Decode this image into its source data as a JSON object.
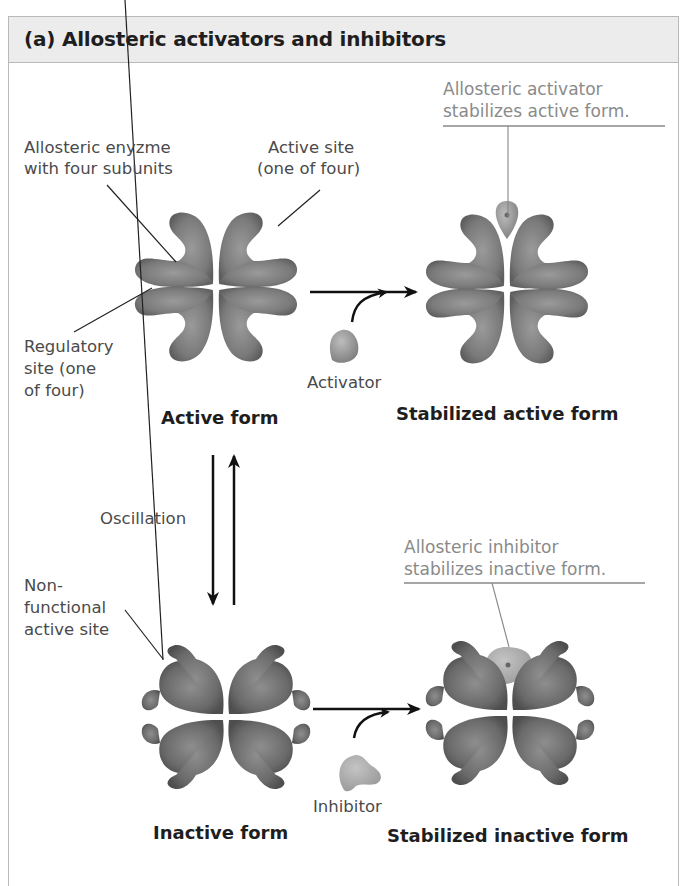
{
  "figure": {
    "title": "(a) Allosteric activators and inhibitors",
    "colors": {
      "enzyme": "#7a7a7a",
      "enzyme_dark": "#5e5e5e",
      "activator": "#8c8c8c",
      "inhibitor": "#a6a6a6",
      "header_bg": "#ececec",
      "frame": "#b9b9b9",
      "callout_text": "#8a8a8a"
    }
  },
  "labels": {
    "enzyme_line1": "Allosteric enyzme",
    "enzyme_line2": "with four subunits",
    "active_site_line1": "Active site",
    "active_site_line2": "(one of four)",
    "regulatory_line1": "Regulatory",
    "regulatory_line2": "site (one",
    "regulatory_line3": "of four)",
    "activator": "Activator",
    "inhibitor": "Inhibitor",
    "oscillation": "Oscillation",
    "nonfunctional_line1": "Non-",
    "nonfunctional_line2": "functional",
    "nonfunctional_line3": "active site"
  },
  "callouts": {
    "activator_line1": "Allosteric activator",
    "activator_line2": "stabilizes active form.",
    "inhibitor_line1": "Allosteric inhibitor",
    "inhibitor_line2": "stabilizes inactive form."
  },
  "states": {
    "active": "Active form",
    "stabilized_active": "Stabilized active form",
    "inactive": "Inactive form",
    "stabilized_inactive": "Stabilized inactive form"
  }
}
